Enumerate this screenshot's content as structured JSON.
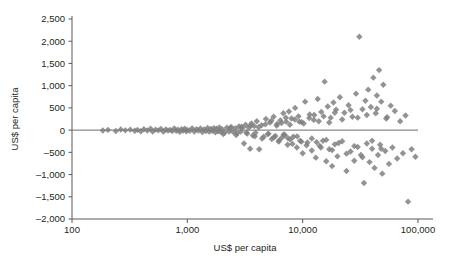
{
  "chart_data": {
    "type": "scatter",
    "title": "",
    "xlabel": "US$ per capita",
    "ylabel": "US$ per capita",
    "xscale": "log",
    "xlim": [
      100,
      100000
    ],
    "ylim": [
      -2000,
      2500
    ],
    "grid": false,
    "legend": null,
    "marker": "diamond",
    "marker_color": "#808080",
    "zero_line": true,
    "xticks": [
      100,
      1000,
      10000,
      100000
    ],
    "xtick_labels": [
      "100",
      "1,000",
      "10,000",
      "100,000"
    ],
    "yticks": [
      -2000,
      -1500,
      -1000,
      -500,
      0,
      500,
      1000,
      1500,
      2000,
      2500
    ],
    "ytick_labels": [
      "-2,000",
      "-1,500",
      "-1,000",
      "-500",
      "0",
      "500",
      "1,000",
      "1,500",
      "2,000",
      "2,500"
    ],
    "points": [
      [
        185,
        -10
      ],
      [
        205,
        5
      ],
      [
        240,
        -20
      ],
      [
        265,
        15
      ],
      [
        290,
        -5
      ],
      [
        320,
        10
      ],
      [
        350,
        -15
      ],
      [
        370,
        5
      ],
      [
        395,
        -25
      ],
      [
        420,
        20
      ],
      [
        450,
        -10
      ],
      [
        480,
        30
      ],
      [
        500,
        -30
      ],
      [
        530,
        10
      ],
      [
        560,
        -5
      ],
      [
        590,
        25
      ],
      [
        620,
        -35
      ],
      [
        650,
        15
      ],
      [
        680,
        -10
      ],
      [
        710,
        5
      ],
      [
        740,
        -20
      ],
      [
        770,
        35
      ],
      [
        800,
        -15
      ],
      [
        830,
        10
      ],
      [
        860,
        -40
      ],
      [
        890,
        20
      ],
      [
        920,
        -10
      ],
      [
        950,
        30
      ],
      [
        980,
        -25
      ],
      [
        1000,
        5
      ],
      [
        1050,
        -15
      ],
      [
        1100,
        40
      ],
      [
        1150,
        -30
      ],
      [
        1200,
        20
      ],
      [
        1250,
        -10
      ],
      [
        1300,
        35
      ],
      [
        1350,
        -45
      ],
      [
        1400,
        15
      ],
      [
        1450,
        -20
      ],
      [
        1500,
        50
      ],
      [
        1550,
        -35
      ],
      [
        1600,
        25
      ],
      [
        1650,
        -15
      ],
      [
        1700,
        45
      ],
      [
        1750,
        -50
      ],
      [
        1800,
        30
      ],
      [
        1850,
        -25
      ],
      [
        1900,
        60
      ],
      [
        1950,
        -40
      ],
      [
        2000,
        20
      ],
      [
        2100,
        -60
      ],
      [
        2200,
        55
      ],
      [
        2300,
        -30
      ],
      [
        2400,
        70
      ],
      [
        2500,
        -45
      ],
      [
        2600,
        35
      ],
      [
        2700,
        -70
      ],
      [
        2800,
        80
      ],
      [
        2900,
        -35
      ],
      [
        3000,
        50
      ],
      [
        3100,
        -300
      ],
      [
        3200,
        120
      ],
      [
        3300,
        -80
      ],
      [
        3400,
        60
      ],
      [
        3500,
        -420
      ],
      [
        3600,
        150
      ],
      [
        3700,
        -120
      ],
      [
        3800,
        90
      ],
      [
        3900,
        -60
      ],
      [
        4000,
        200
      ],
      [
        4200,
        -430
      ],
      [
        4400,
        110
      ],
      [
        4600,
        -150
      ],
      [
        4800,
        250
      ],
      [
        5000,
        -90
      ],
      [
        5200,
        170
      ],
      [
        5400,
        -200
      ],
      [
        5600,
        300
      ],
      [
        5800,
        -130
      ],
      [
        6000,
        140
      ],
      [
        6200,
        -260
      ],
      [
        6400,
        220
      ],
      [
        6600,
        -170
      ],
      [
        6800,
        380
      ],
      [
        7000,
        -110
      ],
      [
        7200,
        190
      ],
      [
        7400,
        -330
      ],
      [
        7600,
        420
      ],
      [
        7800,
        -210
      ],
      [
        8000,
        260
      ],
      [
        8300,
        -150
      ],
      [
        8600,
        500
      ],
      [
        8900,
        -390
      ],
      [
        9200,
        310
      ],
      [
        9500,
        -240
      ],
      [
        9800,
        180
      ],
      [
        10000,
        -520
      ],
      [
        10500,
        640
      ],
      [
        11000,
        -280
      ],
      [
        11500,
        350
      ],
      [
        12000,
        -460
      ],
      [
        12500,
        230
      ],
      [
        13000,
        -620
      ],
      [
        13500,
        700
      ],
      [
        14000,
        -350
      ],
      [
        14500,
        410
      ],
      [
        15000,
        -240
      ],
      [
        15500,
        1090
      ],
      [
        16000,
        -700
      ],
      [
        16500,
        530
      ],
      [
        17000,
        -430
      ],
      [
        17500,
        280
      ],
      [
        18000,
        -810
      ],
      [
        18500,
        620
      ],
      [
        19000,
        -320
      ],
      [
        19500,
        460
      ],
      [
        20000,
        -590
      ],
      [
        21000,
        740
      ],
      [
        22000,
        -250
      ],
      [
        23000,
        390
      ],
      [
        24000,
        -920
      ],
      [
        25000,
        560
      ],
      [
        26000,
        -480
      ],
      [
        27000,
        300
      ],
      [
        28000,
        -690
      ],
      [
        29000,
        820
      ],
      [
        30000,
        -380
      ],
      [
        31000,
        2100
      ],
      [
        32000,
        -560
      ],
      [
        33000,
        470
      ],
      [
        34000,
        -1190
      ],
      [
        35000,
        660
      ],
      [
        36000,
        -300
      ],
      [
        37000,
        910
      ],
      [
        38000,
        -720
      ],
      [
        39000,
        520
      ],
      [
        40000,
        -420
      ],
      [
        41000,
        1180
      ],
      [
        42000,
        -850
      ],
      [
        43000,
        380
      ],
      [
        44000,
        780
      ],
      [
        45000,
        -560
      ],
      [
        46000,
        1350
      ],
      [
        47000,
        -330
      ],
      [
        48000,
        640
      ],
      [
        49000,
        -980
      ],
      [
        50000,
        1020
      ],
      [
        52000,
        -470
      ],
      [
        54000,
        290
      ],
      [
        56000,
        -760
      ],
      [
        58000,
        550
      ],
      [
        60000,
        -390
      ],
      [
        63000,
        430
      ],
      [
        66000,
        -640
      ],
      [
        70000,
        200
      ],
      [
        74000,
        -520
      ],
      [
        78000,
        330
      ],
      [
        82000,
        -1610
      ],
      [
        88000,
        -430
      ],
      [
        95000,
        -600
      ],
      [
        2050,
        -90
      ],
      [
        2350,
        45
      ],
      [
        2650,
        -110
      ],
      [
        2950,
        75
      ],
      [
        3250,
        -55
      ],
      [
        3550,
        95
      ],
      [
        3850,
        -140
      ],
      [
        4150,
        65
      ],
      [
        4450,
        -190
      ],
      [
        4750,
        130
      ],
      [
        5050,
        -80
      ],
      [
        5350,
        210
      ],
      [
        5650,
        -160
      ],
      [
        5950,
        100
      ],
      [
        6250,
        -230
      ],
      [
        6550,
        160
      ],
      [
        6850,
        -100
      ],
      [
        7150,
        280
      ],
      [
        7450,
        -180
      ],
      [
        7750,
        120
      ],
      [
        8150,
        -310
      ],
      [
        8550,
        240
      ],
      [
        8950,
        -140
      ],
      [
        9350,
        190
      ],
      [
        9750,
        -260
      ],
      [
        10200,
        150
      ],
      [
        10800,
        -340
      ],
      [
        11400,
        270
      ],
      [
        12000,
        -190
      ],
      [
        12600,
        340
      ],
      [
        13200,
        -270
      ],
      [
        13800,
        200
      ],
      [
        14400,
        -390
      ],
      [
        15200,
        310
      ],
      [
        16000,
        -220
      ],
      [
        17000,
        170
      ],
      [
        18000,
        -450
      ],
      [
        19000,
        390
      ],
      [
        20500,
        -290
      ],
      [
        22000,
        240
      ],
      [
        24000,
        -530
      ],
      [
        26000,
        450
      ],
      [
        28000,
        -360
      ],
      [
        30000,
        280
      ],
      [
        33000,
        -610
      ],
      [
        36000,
        340
      ],
      [
        40000,
        -240
      ],
      [
        44000,
        480
      ],
      [
        48000,
        -420
      ],
      [
        53000,
        260
      ]
    ]
  }
}
